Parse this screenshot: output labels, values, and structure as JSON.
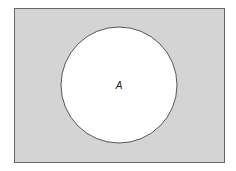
{
  "diagram": {
    "type": "venn",
    "universe": {
      "x": 14,
      "y": 8,
      "width": 210,
      "height": 154,
      "fill": "#d4d4d4",
      "stroke": "#666666"
    },
    "sets": [
      {
        "label": "A",
        "cx": 119,
        "cy": 85,
        "r": 58,
        "fill": "#ffffff",
        "stroke": "#555555"
      }
    ],
    "shaded_region": "complement of A"
  }
}
